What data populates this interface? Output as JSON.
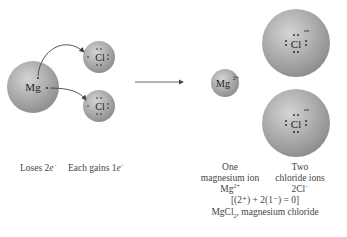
{
  "left": {
    "atom_mg": {
      "symbol": "Mg",
      "cx": 33,
      "cy": 87,
      "r": 26
    },
    "atom_cl": [
      {
        "symbol": "Cl",
        "cx": 99,
        "cy": 57,
        "r": 16
      },
      {
        "symbol": "Cl",
        "cx": 99,
        "cy": 106,
        "r": 16
      }
    ],
    "caption_loses": "Loses 2",
    "caption_loses_e": "e",
    "caption_loses_sup": "−",
    "caption_gains": "Each gains 1",
    "caption_gains_e": "e",
    "caption_gains_sup": "−"
  },
  "arrow": {
    "x1": 135,
    "y1": 82,
    "x2": 184,
    "y2": 82
  },
  "right": {
    "ion_mg": {
      "symbol": "Mg",
      "charge": "2+",
      "cx": 225,
      "cy": 83,
      "r": 14
    },
    "ion_cl": [
      {
        "symbol": "Cl",
        "charge": "−",
        "cx": 296,
        "cy": 43,
        "r": 34
      },
      {
        "symbol": "Cl",
        "charge": "−",
        "cx": 296,
        "cy": 123,
        "r": 34
      }
    ],
    "caption_mg_line1": "One",
    "caption_mg_line2": "magnesium ion",
    "caption_mg_formula": "Mg",
    "caption_mg_formula_sup": "2+",
    "caption_cl_line1": "Two",
    "caption_cl_line2": "chloride ions",
    "caption_cl_formula": "2Cl",
    "caption_cl_formula_sup": "−",
    "charge_balance": "[(2⁺) + 2(1⁻) = 0]",
    "compound_formula_main": "MgCl",
    "compound_formula_sub": "2",
    "compound_name": ", magnesium chloride"
  }
}
